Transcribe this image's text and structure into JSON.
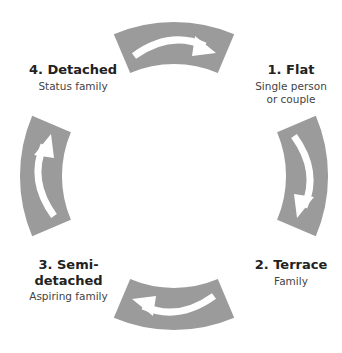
{
  "diagram": {
    "type": "cycle",
    "colors": {
      "segment": "#9a9a9a",
      "arrow": "#ffffff",
      "text": "#222222"
    },
    "stages": [
      {
        "number": "1.",
        "name": "Flat",
        "title": "1. Flat",
        "subtitle_lines": [
          "Single person",
          "or couple"
        ]
      },
      {
        "number": "2.",
        "name": "Terrace",
        "title": "2. Terrace",
        "subtitle_lines": [
          "Family"
        ]
      },
      {
        "number": "3.",
        "name": "Semi-detached",
        "title": "3. Semi-detached",
        "subtitle_lines": [
          "Aspiring family"
        ]
      },
      {
        "number": "4.",
        "name": "Detached",
        "title": "4. Detached",
        "subtitle_lines": [
          "Status family"
        ]
      }
    ],
    "arrows": [
      {
        "position": "top",
        "direction": "clockwise"
      },
      {
        "position": "right",
        "direction": "clockwise"
      },
      {
        "position": "bottom",
        "direction": "clockwise"
      },
      {
        "position": "left",
        "direction": "clockwise"
      }
    ]
  }
}
